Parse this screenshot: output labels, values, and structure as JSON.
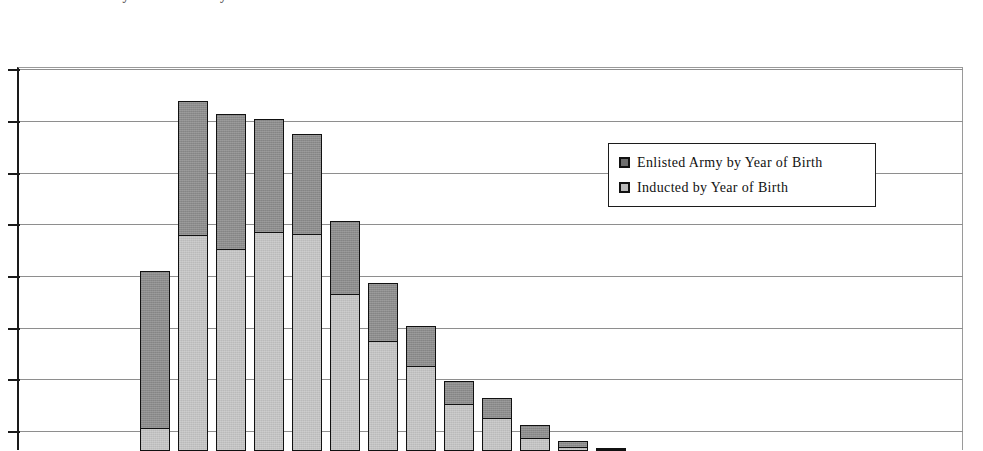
{
  "title": {
    "text": "Enlisted Army and Inducted by Year of Birth",
    "cropped": true
  },
  "legend": {
    "position": "inside-top-right",
    "items": [
      {
        "label": "Enlisted Army by Year of Birth",
        "swatch": "legend-swatch-dark-gray",
        "color": "#6e6e6e"
      },
      {
        "label": "Inducted by Year of Birth",
        "swatch": "legend-swatch-light-gray",
        "color": "#b9b9b9"
      }
    ]
  },
  "axes": {
    "y_tick_count": 8,
    "y_gridlines_px": [
      68,
      120,
      172,
      223,
      275,
      327,
      378,
      430
    ],
    "x_axis_labels_visible": false,
    "y_axis_labels_visible": false
  },
  "chart_data": {
    "type": "bar",
    "subtype": "stacked-column",
    "title": "Enlisted Army and Inducted by Year of Birth",
    "xlabel": "",
    "ylabel": "",
    "grid": true,
    "legend_position": "inside-top-right",
    "ylim": [
      0,
      800
    ],
    "categories": [
      "1",
      "2",
      "3",
      "4",
      "5",
      "6",
      "7",
      "8",
      "9",
      "10",
      "11",
      "12",
      "13"
    ],
    "series": [
      {
        "name": "Inducted by Year of Birth",
        "color": "#c2c2c2",
        "values": [
          60,
          375,
          340,
          380,
          370,
          285,
          250,
          215,
          150,
          130,
          95,
          62,
          30
        ]
      },
      {
        "name": "Enlisted Army by Year of Birth",
        "color": "#8c8c8c",
        "values": [
          290,
          320,
          295,
          275,
          230,
          145,
          115,
          80,
          70,
          55,
          45,
          30,
          20
        ]
      }
    ],
    "totals": [
      350,
      695,
      635,
      655,
      600,
      430,
      365,
      295,
      220,
      185,
      140,
      92,
      50
    ]
  },
  "bars_px": [
    {
      "left": 138,
      "width": 30,
      "top": 270,
      "split": 428
    },
    {
      "left": 176,
      "width": 30,
      "top": 100,
      "split": 235
    },
    {
      "left": 214,
      "width": 30,
      "top": 113,
      "split": 249
    },
    {
      "left": 252,
      "width": 30,
      "top": 118,
      "split": 232
    },
    {
      "left": 290,
      "width": 30,
      "top": 133,
      "split": 234
    },
    {
      "left": 328,
      "width": 30,
      "top": 220,
      "split": 294
    },
    {
      "left": 366,
      "width": 30,
      "top": 282,
      "split": 341
    },
    {
      "left": 404,
      "width": 30,
      "top": 325,
      "split": 366
    },
    {
      "left": 442,
      "width": 30,
      "top": 380,
      "split": 404
    },
    {
      "left": 480,
      "width": 30,
      "top": 397,
      "split": 418
    },
    {
      "left": 518,
      "width": 30,
      "top": 424,
      "split": 438
    },
    {
      "left": 556,
      "width": 30,
      "top": 440,
      "split": 447
    },
    {
      "left": 594,
      "width": 30,
      "top": 447,
      "split": 449
    }
  ]
}
